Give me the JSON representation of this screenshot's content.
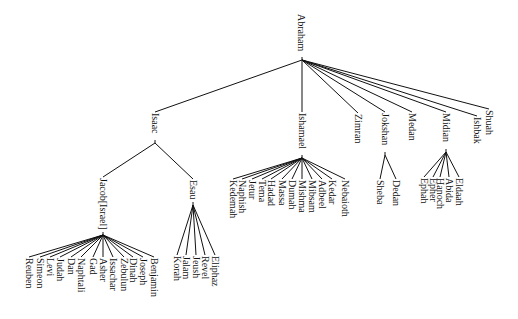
{
  "diagram": {
    "type": "tree",
    "orientation": "top-down, vertical labels",
    "line_color": "#111111",
    "text_color": "#111111",
    "nodes": [
      {
        "id": "abraham",
        "label": "Abraham",
        "x": 301,
        "y": 14,
        "jx": 302,
        "jy": 60
      },
      {
        "id": "isaac",
        "label": "Isaac",
        "x": 155,
        "y": 113,
        "jx": 155,
        "jy": 143,
        "parent": "abraham"
      },
      {
        "id": "ishamael",
        "label": "Ishamael",
        "x": 302,
        "y": 113,
        "jx": 302,
        "jy": 158,
        "parent": "abraham"
      },
      {
        "id": "zimran",
        "label": "Zimran",
        "x": 358,
        "y": 114,
        "parent": "abraham"
      },
      {
        "id": "jokshan",
        "label": "Jokshan",
        "x": 385,
        "y": 113,
        "jx": 385,
        "jy": 155,
        "parent": "abraham"
      },
      {
        "id": "medan",
        "label": "Medan",
        "x": 412,
        "y": 113,
        "parent": "abraham"
      },
      {
        "id": "midian",
        "label": "Midian",
        "x": 446,
        "y": 113,
        "jx": 446,
        "jy": 152,
        "parent": "abraham"
      },
      {
        "id": "ishbak",
        "label": "Ishbak",
        "x": 477,
        "y": 117,
        "parent": "abraham"
      },
      {
        "id": "shuah",
        "label": "Shuah",
        "x": 489,
        "y": 110,
        "parent": "abraham"
      },
      {
        "id": "jacob",
        "label": "Jacob[Israel]",
        "x": 103,
        "y": 178,
        "jx": 103,
        "jy": 235,
        "parent": "isaac"
      },
      {
        "id": "esau",
        "label": "Esau",
        "x": 193,
        "y": 180,
        "jx": 193,
        "jy": 205,
        "parent": "isaac"
      },
      {
        "id": "reuben",
        "label": "Reuben",
        "x": 29,
        "y": 258,
        "parent": "jacob"
      },
      {
        "id": "simeon",
        "label": "Simeon",
        "x": 40,
        "y": 258,
        "parent": "jacob"
      },
      {
        "id": "levi",
        "label": "Levi",
        "x": 50,
        "y": 258,
        "parent": "jacob"
      },
      {
        "id": "judah",
        "label": "Judah",
        "x": 60,
        "y": 258,
        "parent": "jacob"
      },
      {
        "id": "dan",
        "label": "Dan",
        "x": 71,
        "y": 258,
        "parent": "jacob"
      },
      {
        "id": "naphtali",
        "label": "Naphtali",
        "x": 81,
        "y": 258,
        "parent": "jacob"
      },
      {
        "id": "gad",
        "label": "Gad",
        "x": 93,
        "y": 258,
        "parent": "jacob"
      },
      {
        "id": "asher",
        "label": "Asher",
        "x": 103,
        "y": 258,
        "parent": "jacob"
      },
      {
        "id": "issachar",
        "label": "Issachar",
        "x": 113,
        "y": 258,
        "parent": "jacob"
      },
      {
        "id": "zebulun",
        "label": "Zebulun",
        "x": 124,
        "y": 258,
        "parent": "jacob"
      },
      {
        "id": "dinah",
        "label": "Dinah",
        "x": 133,
        "y": 258,
        "parent": "jacob"
      },
      {
        "id": "joseph",
        "label": "Joseph",
        "x": 143,
        "y": 258,
        "parent": "jacob"
      },
      {
        "id": "benjamin",
        "label": "Benjamin",
        "x": 154,
        "y": 258,
        "parent": "jacob"
      },
      {
        "id": "korah",
        "label": "Korah",
        "x": 177,
        "y": 256,
        "parent": "esau"
      },
      {
        "id": "jalam",
        "label": "Jalam",
        "x": 186,
        "y": 256,
        "parent": "esau"
      },
      {
        "id": "jeush",
        "label": "Jeush",
        "x": 196,
        "y": 256,
        "parent": "esau"
      },
      {
        "id": "revel",
        "label": "Revel",
        "x": 205,
        "y": 256,
        "parent": "esau"
      },
      {
        "id": "eliphaz",
        "label": "Eliphaz",
        "x": 215,
        "y": 256,
        "parent": "esau"
      },
      {
        "id": "kedemah",
        "label": "Kedemah",
        "x": 233,
        "y": 180,
        "parent": "ishamael"
      },
      {
        "id": "naphish",
        "label": "Naphish",
        "x": 242,
        "y": 180,
        "parent": "ishamael"
      },
      {
        "id": "jetur",
        "label": "Jetur",
        "x": 252,
        "y": 180,
        "parent": "ishamael"
      },
      {
        "id": "tema",
        "label": "Tema",
        "x": 262,
        "y": 180,
        "parent": "ishamael"
      },
      {
        "id": "hadad",
        "label": "Hadad",
        "x": 271,
        "y": 180,
        "parent": "ishamael"
      },
      {
        "id": "massa",
        "label": "Massa",
        "x": 282,
        "y": 180,
        "parent": "ishamael"
      },
      {
        "id": "dumah",
        "label": "Dumah",
        "x": 292,
        "y": 180,
        "parent": "ishamael"
      },
      {
        "id": "mishma",
        "label": "Mishma",
        "x": 302,
        "y": 180,
        "parent": "ishamael"
      },
      {
        "id": "mibsam",
        "label": "Mibsam",
        "x": 312,
        "y": 180,
        "parent": "ishamael"
      },
      {
        "id": "adbeel",
        "label": "Adbeel",
        "x": 322,
        "y": 180,
        "parent": "ishamael"
      },
      {
        "id": "kedar",
        "label": "Kedar",
        "x": 332,
        "y": 180,
        "parent": "ishamael"
      },
      {
        "id": "nebaioth",
        "label": "Nebaioth",
        "x": 345,
        "y": 180,
        "parent": "ishamael"
      },
      {
        "id": "sheba",
        "label": "Sheba",
        "x": 380,
        "y": 180,
        "parent": "jokshan"
      },
      {
        "id": "dedan",
        "label": "Dedan",
        "x": 396,
        "y": 180,
        "parent": "jokshan"
      },
      {
        "id": "ephah",
        "label": "Ephah",
        "x": 424,
        "y": 178,
        "parent": "midian"
      },
      {
        "id": "epher",
        "label": "Epher",
        "x": 433,
        "y": 178,
        "parent": "midian"
      },
      {
        "id": "hanoch",
        "label": "Hanoch",
        "x": 440,
        "y": 178,
        "parent": "midian"
      },
      {
        "id": "abida",
        "label": "Abida",
        "x": 449,
        "y": 178,
        "parent": "midian"
      },
      {
        "id": "eldaah",
        "label": "Eldaah",
        "x": 459,
        "y": 178,
        "parent": "midian"
      }
    ]
  }
}
